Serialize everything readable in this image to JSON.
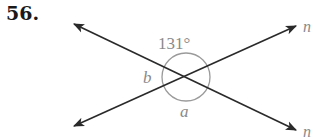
{
  "problem": {
    "number": "56."
  },
  "diagram": {
    "angle_given": "131°",
    "angle_a": "a",
    "angle_b": "b",
    "line_labels": [
      "n",
      "n"
    ],
    "colors": {
      "line": "#2a2a2a",
      "label": "#8a8a8a",
      "arc": "#9a9a9a"
    }
  }
}
